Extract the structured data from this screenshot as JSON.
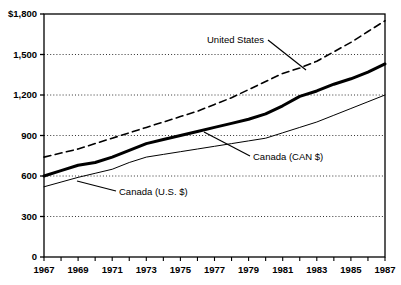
{
  "chart_data": {
    "type": "line",
    "title": "",
    "subtitle": "",
    "xlabel": "",
    "ylabel": "",
    "xlim": [
      1967,
      1987
    ],
    "ylim": [
      0,
      1800
    ],
    "grid": "horizontal-dotted",
    "legend_position": "inline-annotations",
    "x": [
      1967,
      1968,
      1969,
      1970,
      1971,
      1972,
      1973,
      1974,
      1975,
      1976,
      1977,
      1978,
      1979,
      1980,
      1981,
      1982,
      1983,
      1984,
      1985,
      1986,
      1987
    ],
    "y_ticks": [
      0,
      300,
      600,
      900,
      1200,
      1500,
      1800
    ],
    "y_tick_labels": [
      "0",
      "300",
      "600",
      "900",
      "1,200",
      "1,500",
      "$1,800"
    ],
    "x_ticks": [
      1967,
      1968,
      1969,
      1970,
      1971,
      1972,
      1973,
      1974,
      1975,
      1976,
      1977,
      1978,
      1979,
      1980,
      1981,
      1982,
      1983,
      1984,
      1985,
      1986,
      1987
    ],
    "x_tick_labels": [
      "1967",
      "",
      "1969",
      "",
      "1971",
      "",
      "1973",
      "",
      "1975",
      "",
      "1977",
      "",
      "1979",
      "",
      "1981",
      "",
      "1983",
      "",
      "1985",
      "",
      "1987"
    ],
    "series": [
      {
        "name": "United States",
        "style": "dashed",
        "color": "#000000",
        "width": 1.6,
        "values": [
          740,
          770,
          800,
          840,
          880,
          920,
          960,
          1000,
          1040,
          1080,
          1130,
          1180,
          1240,
          1300,
          1360,
          1400,
          1450,
          1520,
          1590,
          1670,
          1750
        ]
      },
      {
        "name": "Canada (CAN $)",
        "style": "solid-thick",
        "color": "#000000",
        "width": 3.0,
        "values": [
          600,
          640,
          680,
          700,
          740,
          790,
          840,
          870,
          900,
          930,
          960,
          990,
          1020,
          1060,
          1120,
          1190,
          1230,
          1280,
          1320,
          1370,
          1430
        ]
      },
      {
        "name": "Canada (U.S. $)",
        "style": "solid-thin",
        "color": "#000000",
        "width": 1.0,
        "values": [
          520,
          555,
          590,
          620,
          650,
          700,
          740,
          760,
          780,
          800,
          820,
          840,
          860,
          880,
          920,
          960,
          1000,
          1050,
          1100,
          1150,
          1200
        ]
      }
    ],
    "annotations": [
      {
        "text": "United States",
        "text_x": 207,
        "text_y": 43,
        "leader_from_x": 268,
        "leader_from_y": 40,
        "leader_to_x": 306,
        "leader_to_y": 70
      },
      {
        "text": "Canada (CAN $)",
        "text_x": 253,
        "text_y": 160,
        "leader_from_x": 250,
        "leader_from_y": 156,
        "leader_to_x": 204,
        "leader_to_y": 132
      },
      {
        "text": "Canada (U.S. $)",
        "text_x": 119,
        "text_y": 195,
        "leader_from_x": 116,
        "leader_from_y": 191,
        "leader_to_x": 77,
        "leader_to_y": 181
      }
    ]
  }
}
